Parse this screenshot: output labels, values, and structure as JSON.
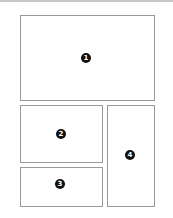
{
  "diagram": {
    "type": "page-layout-regions",
    "colors": {
      "border": "#9a9a9a",
      "badge_fill": "#111111",
      "badge_text": "#ffffff",
      "top_rule": "#c8c8c8"
    },
    "regions": [
      {
        "id": 1,
        "label": "1",
        "x": 20,
        "y": 15,
        "w": 135,
        "h": 86,
        "badge": {
          "cx": 86,
          "cy": 58
        }
      },
      {
        "id": 2,
        "label": "2",
        "x": 20,
        "y": 105,
        "w": 83,
        "h": 58,
        "badge": {
          "cx": 61,
          "cy": 134
        }
      },
      {
        "id": 3,
        "label": "3",
        "x": 20,
        "y": 167,
        "w": 83,
        "h": 40,
        "badge": {
          "cx": 60,
          "cy": 184
        }
      },
      {
        "id": 4,
        "label": "4",
        "x": 107,
        "y": 105,
        "w": 48,
        "h": 102,
        "badge": {
          "cx": 130,
          "cy": 155
        }
      }
    ]
  }
}
